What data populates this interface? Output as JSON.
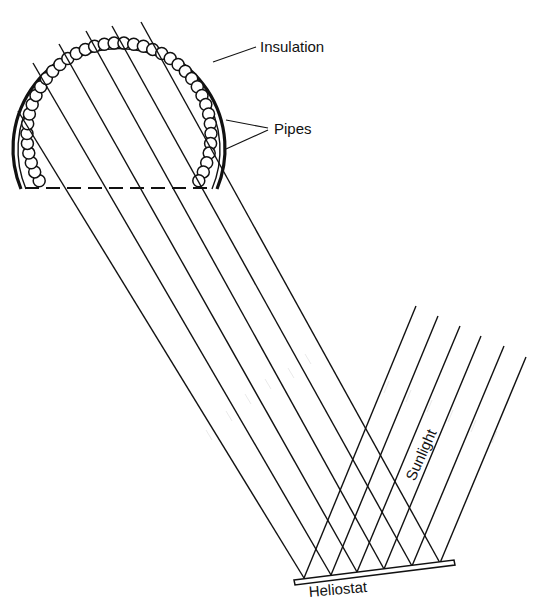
{
  "diagram": {
    "labels": {
      "insulation": "Insulation",
      "pipes": "Pipes",
      "sunlight": "Sunlight",
      "heliostat": "Heliostat"
    },
    "components": [
      {
        "id": "receiver",
        "description": "Semicircular receiver cavity lined with pipes, wrapped in insulation"
      },
      {
        "id": "aperture",
        "description": "Dashed aperture line at bottom of receiver"
      },
      {
        "id": "heliostat",
        "description": "Flat mirror reflecting sunlight up into receiver"
      },
      {
        "id": "sunlight-rays",
        "count": 6,
        "direction": "incoming, down-left toward heliostat"
      },
      {
        "id": "reflected-rays",
        "count": 6,
        "direction": "outgoing, up-left into receiver"
      }
    ],
    "colors": {
      "line": "#111111",
      "background": "#ffffff"
    }
  }
}
